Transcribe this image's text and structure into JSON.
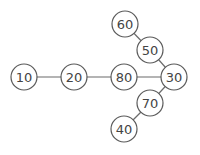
{
  "diagram": {
    "type": "graph",
    "node_radius": 13,
    "colors": {
      "edge": "#6b6b6b",
      "node_stroke": "#5a5a5a",
      "node_fill": "#ffffff",
      "label": "#444444"
    },
    "nodes": [
      {
        "id": "n10",
        "label": "10",
        "x": 24,
        "y": 77
      },
      {
        "id": "n20",
        "label": "20",
        "x": 74,
        "y": 77
      },
      {
        "id": "n80",
        "label": "80",
        "x": 124,
        "y": 77
      },
      {
        "id": "n30",
        "label": "30",
        "x": 174,
        "y": 77
      },
      {
        "id": "n60",
        "label": "60",
        "x": 125,
        "y": 24
      },
      {
        "id": "n50",
        "label": "50",
        "x": 150,
        "y": 50
      },
      {
        "id": "n70",
        "label": "70",
        "x": 150,
        "y": 103
      },
      {
        "id": "n40",
        "label": "40",
        "x": 124,
        "y": 129
      }
    ],
    "edges": [
      {
        "from": "n10",
        "to": "n20"
      },
      {
        "from": "n20",
        "to": "n80"
      },
      {
        "from": "n80",
        "to": "n30"
      },
      {
        "from": "n60",
        "to": "n50"
      },
      {
        "from": "n50",
        "to": "n30"
      },
      {
        "from": "n30",
        "to": "n70"
      },
      {
        "from": "n70",
        "to": "n40"
      }
    ]
  }
}
